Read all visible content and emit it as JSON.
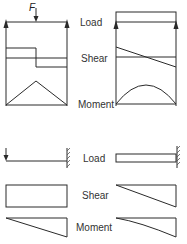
{
  "labels": {
    "top": {
      "load": "Load",
      "shear": "Shear",
      "moment": "Moment"
    },
    "bottom": {
      "load": "Load",
      "shear": "Shear",
      "moment": "Moment"
    }
  },
  "force_label": "F",
  "cases": [
    {
      "id": "simply-supported-point-load",
      "support": "simply supported",
      "load": "concentrated force F at midspan",
      "shear": "step",
      "moment": "triangular"
    },
    {
      "id": "simply-supported-uniform-load",
      "support": "simply supported",
      "load": "uniformly distributed",
      "shear": "linear",
      "moment": "parabolic"
    },
    {
      "id": "cantilever-point-load",
      "support": "cantilever (fixed right end)",
      "load": "concentrated force at free end",
      "shear": "constant",
      "moment": "linear"
    },
    {
      "id": "cantilever-uniform-load",
      "support": "cantilever (fixed right end)",
      "load": "uniformly distributed",
      "shear": "linear",
      "moment": "parabolic"
    }
  ],
  "colors": {
    "line": "#2a2a2a",
    "text": "#333333",
    "background": "#ffffff"
  }
}
